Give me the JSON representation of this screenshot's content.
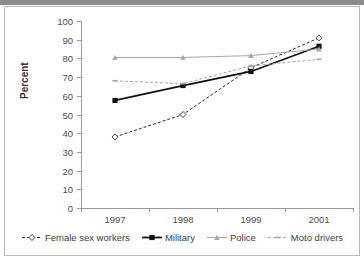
{
  "chart_data": {
    "type": "line",
    "title": "",
    "subtitle": "",
    "xlabel": "",
    "ylabel": "Percent",
    "categories": [
      "1997",
      "1998",
      "1999",
      "2001"
    ],
    "x_tick_labels": [
      "1997",
      "1998",
      "1999",
      "2001"
    ],
    "y_tick_labels": [
      "0",
      "10",
      "20",
      "30",
      "40",
      "50",
      "60",
      "70",
      "80",
      "90",
      "100"
    ],
    "y_ticks": [
      0,
      10,
      20,
      30,
      40,
      50,
      60,
      70,
      80,
      90,
      100
    ],
    "ylim": [
      0,
      100
    ],
    "grid": false,
    "legend_position": "bottom",
    "series": [
      {
        "name": "Female sex workers",
        "values": [
          38,
          50,
          75,
          91
        ],
        "color": "#2b2b2b",
        "line_style": "dashed",
        "marker": "open-diamond"
      },
      {
        "name": "Military",
        "values": [
          57.5,
          65.5,
          73,
          86.5
        ],
        "color": "#111111",
        "line_style": "solid",
        "marker": "filled-square"
      },
      {
        "name": "Police",
        "values": [
          80.5,
          80.5,
          81.5,
          85
        ],
        "color": "#a6a6a6",
        "line_style": "solid",
        "marker": "triangle"
      },
      {
        "name": "Moto drivers",
        "values": [
          68,
          66.5,
          76,
          79.5
        ],
        "color": "#a6a6a6",
        "line_style": "dashed",
        "marker": "small-dash"
      }
    ]
  },
  "figure": {
    "axis_color": "#9a9a9a",
    "tick_label_color": "#4d4d4d",
    "axis_title_color": "#333333",
    "legend_text_color": "#3d3d3d",
    "header_bar_color": "#8d8d8d",
    "frame_border_color": "#b9b9b9",
    "background": "#ffffff"
  }
}
